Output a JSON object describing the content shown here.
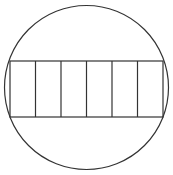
{
  "diagram": {
    "stroke_color": "#333333",
    "background": "#ffffff",
    "circle": {
      "cx": 86.5,
      "cy": 87.5,
      "r": 82
    },
    "rectangle": {
      "x": 10,
      "y": 61,
      "width": 153,
      "height": 56
    },
    "sections": 6
  }
}
